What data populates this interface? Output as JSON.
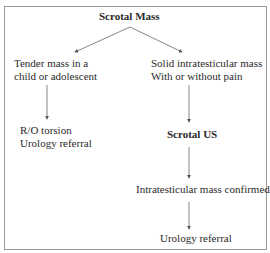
{
  "diagram": {
    "root": "Scrotal Mass",
    "left_branch": {
      "condition_line1": "Tender mass in a",
      "condition_line2": "child or adolescent",
      "action_line1": "R/O torsion",
      "action_line2": "Urology referral"
    },
    "right_branch": {
      "condition_line1": "Solid intratesticular mass",
      "condition_line2": "With or without pain",
      "test": "Scrotal US",
      "finding": "Intratesticular mass confirmed",
      "action": "Urology referral"
    },
    "colors": {
      "border": "#9a9a9a",
      "arrow": "#555555",
      "text": "#2a2a2a"
    }
  }
}
